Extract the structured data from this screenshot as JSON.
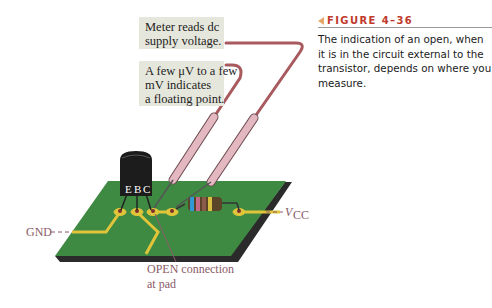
{
  "figure": {
    "number_label": "FIGURE 4–36",
    "caption_lines": [
      "The indication of an open, when",
      "it is in the circuit external to the",
      "transistor, depends on where you",
      "measure."
    ],
    "accent_color": "#c0392b"
  },
  "callouts": {
    "meter_dc": {
      "lines": [
        "Meter reads dc",
        "supply voltage."
      ]
    },
    "floating": {
      "lines": [
        "A few μV to a few",
        "mV indicates",
        "a floating point."
      ]
    }
  },
  "labels": {
    "gnd": "GND",
    "vcc_main": "V",
    "vcc_sub": "CC",
    "open_line1": "OPEN connection",
    "open_line2": "at pad",
    "transistor_pins": [
      "E",
      "B",
      "C"
    ]
  },
  "colors": {
    "pcb": "#3f8a43",
    "trace": "#e0c53a",
    "probe": "#d9a9b0",
    "lead": "#a85a5e",
    "callout_bg": "#e6e7dc",
    "label_text": "#8a5a66"
  }
}
